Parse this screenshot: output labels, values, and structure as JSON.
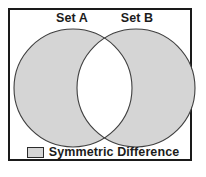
{
  "figure": {
    "type": "venn-diagram",
    "concept": "Symmetric Difference",
    "frame_color": "#1a1a1a",
    "background_color": "#ffffff"
  },
  "sets": [
    {
      "id": "a",
      "label": "Set A",
      "cx": 73,
      "cy": 88,
      "r": 59
    },
    {
      "id": "b",
      "label": "Set B",
      "cx": 136,
      "cy": 88,
      "r": 59
    }
  ],
  "regions": {
    "shaded": {
      "name": "Symmetric Difference",
      "fill": "#d5d5d5",
      "stroke": "#3f3f3f"
    },
    "intersection": {
      "name": "Intersection",
      "fill": "#ffffff",
      "stroke": "#3f3f3f"
    }
  },
  "legend": {
    "swatch_fill": "#d5d5d5",
    "swatch_border": "#2b2b2b",
    "label": "Symmetric Difference"
  }
}
